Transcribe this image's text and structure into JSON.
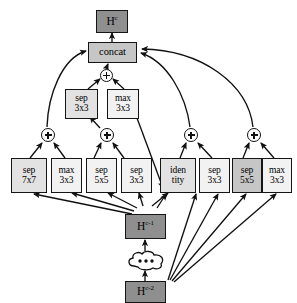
{
  "diagram": {
    "colors": {
      "stroke": "#151515",
      "state_fill": "#8f8f8f",
      "concat_fill": "#c6c6c6",
      "op_fill_light": "#e2e2e2",
      "op_fill_pale": "#f2f2f2",
      "background": "#ffffff"
    },
    "output_node": {
      "label": "H",
      "superscript": "c",
      "name": "H^c"
    },
    "concat_node": {
      "label": "concat"
    },
    "state_prev1": {
      "label": "H",
      "superscript": "c-1",
      "name": "H^c-1"
    },
    "state_prev2": {
      "label": "H",
      "superscript": "c-2",
      "name": "H^c-2"
    },
    "ellipsis_cloud": {
      "label": "•••"
    },
    "add_nodes": [
      {
        "id": "add-top",
        "label": "+"
      },
      {
        "id": "add-1",
        "label": "+"
      },
      {
        "id": "add-2",
        "label": "+"
      },
      {
        "id": "add-3",
        "label": "+"
      },
      {
        "id": "add-4",
        "label": "+"
      }
    ],
    "mid_ops": [
      {
        "id": "mid-sep-3x3",
        "line1": "sep",
        "line2": "3x3",
        "tone": "tone-light"
      },
      {
        "id": "mid-max-3x3",
        "line1": "max",
        "line2": "3x3",
        "tone": "tone-pale"
      }
    ],
    "bottom_ops": [
      {
        "id": "op-sep-7x7",
        "line1": "sep",
        "line2": "7x7",
        "tone": "tone-light"
      },
      {
        "id": "op-max-3x3a",
        "line1": "max",
        "line2": "3x3",
        "tone": "tone-pale"
      },
      {
        "id": "op-sep-5x5a",
        "line1": "sep",
        "line2": "5x5",
        "tone": "tone-pale"
      },
      {
        "id": "op-sep-3x3",
        "line1": "sep",
        "line2": "3x3",
        "tone": "tone-pale"
      },
      {
        "id": "op-identity",
        "line1": "iden",
        "line2": "tity",
        "tone": "tone-light"
      },
      {
        "id": "op-sep-3x3b",
        "line1": "sep",
        "line2": "3x3",
        "tone": "tone-pale"
      },
      {
        "id": "op-sep-5x5b",
        "line1": "sep",
        "line2": "5x5",
        "tone": "tone-mid"
      },
      {
        "id": "op-max-3x3b",
        "line1": "max",
        "line2": "3x3",
        "tone": "tone-pale"
      }
    ]
  }
}
